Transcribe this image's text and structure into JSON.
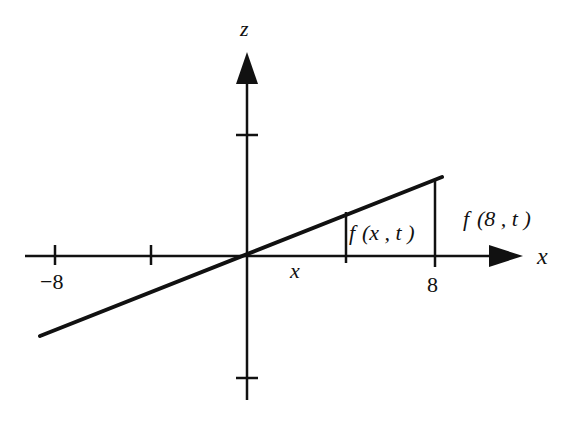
{
  "axes": {
    "vertical_label": "z",
    "horizontal_label": "x"
  },
  "ticks": {
    "neg8": "−8",
    "pos8": "8",
    "x_var": "x"
  },
  "annotations": {
    "fx": {
      "f": "f",
      "args": "(x , t )"
    },
    "f8": {
      "f": "f",
      "args": "(8 , t )"
    }
  },
  "colors": {
    "ink": "#111111",
    "background": "#ffffff"
  }
}
